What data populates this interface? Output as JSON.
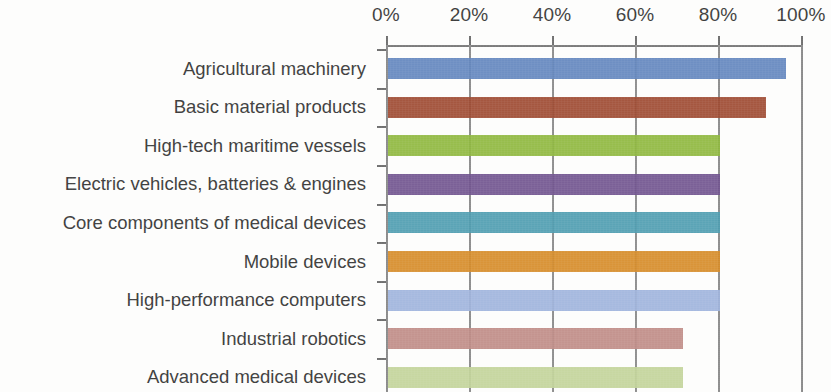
{
  "chart_data": {
    "type": "bar",
    "orientation": "horizontal",
    "title": "",
    "subtitle": "",
    "xlabel": "",
    "ylabel": "",
    "xlim": [
      0,
      100
    ],
    "xtick_labels": [
      "0%",
      "20%",
      "40%",
      "60%",
      "80%",
      "100%"
    ],
    "xticks": [
      0,
      20,
      40,
      60,
      80,
      100
    ],
    "grid": true,
    "grid_axis": "x",
    "legend": "none",
    "axis_position": "top",
    "note": "Bottom of chart is cropped; last bar is partially visible.",
    "categories": [
      "Agricultural machinery",
      "Basic material products",
      "High-tech maritime vessels",
      "Electric vehicles, batteries & engines",
      "Core components of medical devices",
      "Mobile devices",
      "High-performance computers",
      "Industrial robotics",
      "Advanced medical devices"
    ],
    "values": [
      96,
      91,
      80,
      80,
      80,
      80,
      80,
      71,
      71
    ],
    "colors": [
      "#6386be",
      "#9e4a32",
      "#8fb83e",
      "#71548f",
      "#4f9db0",
      "#d68c29",
      "#9fb4dd",
      "#c08c86",
      "#c3d49a"
    ]
  }
}
